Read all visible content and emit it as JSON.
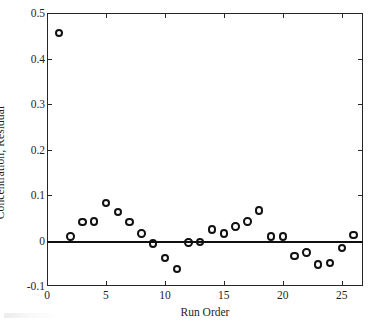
{
  "chart_data": {
    "type": "scatter",
    "title": "",
    "xlabel": "Run Order",
    "ylabel": "Concentration, Residual",
    "xlim": [
      0,
      26.8
    ],
    "ylim": [
      -0.1,
      0.5
    ],
    "xticks": [
      0,
      5,
      10,
      15,
      20,
      25
    ],
    "xtick_labels": [
      "0",
      "5",
      "10",
      "15",
      "20",
      "25"
    ],
    "yticks": [
      -0.1,
      0,
      0.1,
      0.2,
      0.3,
      0.4,
      0.5
    ],
    "ytick_labels": [
      "-0.1",
      "0",
      "0.1",
      "0.2",
      "0.3",
      "0.4",
      "0.5"
    ],
    "grid": false,
    "legend": null,
    "marker_style": "open-circle",
    "marker_color": "#111111",
    "reference_line": {
      "name": "zero-line",
      "orientation": "horizontal",
      "y": 0,
      "color": "#101010"
    },
    "x": [
      1,
      2,
      3,
      4,
      5,
      6,
      7,
      8,
      9,
      10,
      11,
      12,
      13,
      14,
      15,
      16,
      17,
      18,
      19,
      20,
      21,
      22,
      23,
      24,
      25,
      26
    ],
    "y": [
      0.456,
      0.009,
      0.041,
      0.042,
      0.083,
      0.063,
      0.041,
      0.015,
      -0.007,
      -0.038,
      -0.062,
      -0.004,
      -0.003,
      0.024,
      0.015,
      0.031,
      0.042,
      0.066,
      0.009,
      0.009,
      -0.034,
      -0.026,
      -0.053,
      -0.049,
      -0.017,
      0.012
    ],
    "series": [
      {
        "name": "Concentration Residual",
        "x": [
          1,
          2,
          3,
          4,
          5,
          6,
          7,
          8,
          9,
          10,
          11,
          12,
          13,
          14,
          15,
          16,
          17,
          18,
          19,
          20,
          21,
          22,
          23,
          24,
          25,
          26
        ],
        "values": [
          0.456,
          0.009,
          0.041,
          0.042,
          0.083,
          0.063,
          0.041,
          0.015,
          -0.007,
          -0.038,
          -0.062,
          -0.004,
          -0.003,
          0.024,
          0.015,
          0.031,
          0.042,
          0.066,
          0.009,
          0.009,
          -0.034,
          -0.026,
          -0.053,
          -0.049,
          -0.017,
          0.012
        ]
      }
    ]
  }
}
